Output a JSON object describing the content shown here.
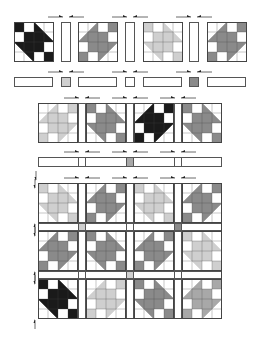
{
  "colors": {
    "dark": "#1a1a1a",
    "mid": "#8a8a8a",
    "midlight": "#a8a8a8",
    "light": "#cfcfcf",
    "outline": "#444444",
    "white": "#ffffff"
  },
  "step1_row": {
    "blocks": [
      {
        "x": 14,
        "shade": "dark",
        "orient": "R"
      },
      {
        "x": 78,
        "shade": "mid",
        "orient": "L"
      },
      {
        "x": 143,
        "shade": "light",
        "orient": "R"
      },
      {
        "x": 207,
        "shade": "mid",
        "orient": "L"
      }
    ],
    "sashes": [
      {
        "x": 61
      },
      {
        "x": 125
      },
      {
        "x": 189
      }
    ],
    "y": 22
  },
  "step1_sash_row": {
    "y": 77,
    "strips": [
      {
        "x": 14
      },
      {
        "x": 78
      },
      {
        "x": 143
      },
      {
        "x": 207
      }
    ],
    "cornerstones": [
      {
        "x": 61,
        "shade": "light"
      },
      {
        "x": 125,
        "shade": "white"
      },
      {
        "x": 189,
        "shade": "mid"
      }
    ]
  },
  "step2_row": {
    "y": 103,
    "blocks": [
      {
        "x": 38,
        "shade": "light",
        "orient": "L"
      },
      {
        "x": 86,
        "shade": "mid",
        "orient": "R"
      },
      {
        "x": 134,
        "shade": "dark",
        "orient": "L"
      },
      {
        "x": 182,
        "shade": "mid",
        "orient": "R"
      }
    ]
  },
  "step2_sash_row": {
    "y": 157,
    "cornerstones": [
      {
        "x": 78,
        "shade": "white"
      },
      {
        "x": 126,
        "shade": "midlight"
      },
      {
        "x": 174,
        "shade": "white"
      }
    ]
  },
  "quilt_top": {
    "x": 38,
    "y": 183,
    "rows": [
      [
        {
          "shade": "light",
          "orient": "R"
        },
        {
          "shade": "mid",
          "orient": "L"
        },
        {
          "shade": "light",
          "orient": "R"
        },
        {
          "shade": "mid",
          "orient": "L"
        }
      ],
      [
        {
          "shade": "mid",
          "orient": "L"
        },
        {
          "shade": "mid",
          "orient": "R"
        },
        {
          "shade": "mid",
          "orient": "L"
        },
        {
          "shade": "light",
          "orient": "R"
        }
      ],
      [
        {
          "shade": "dark",
          "orient": "R"
        },
        {
          "shade": "light",
          "orient": "L"
        },
        {
          "shade": "mid",
          "orient": "R"
        },
        {
          "shade": "midlight",
          "orient": "L"
        }
      ]
    ],
    "sash_cornerstones": [
      [
        {
          "shade": "light"
        },
        {
          "shade": "white"
        },
        {
          "shade": "mid"
        }
      ],
      [
        {
          "shade": "white"
        },
        {
          "shade": "light"
        },
        {
          "shade": "white"
        }
      ]
    ]
  },
  "pressing_arrows": {
    "description": "Arrows indicate seam pressing direction toward sashing"
  }
}
